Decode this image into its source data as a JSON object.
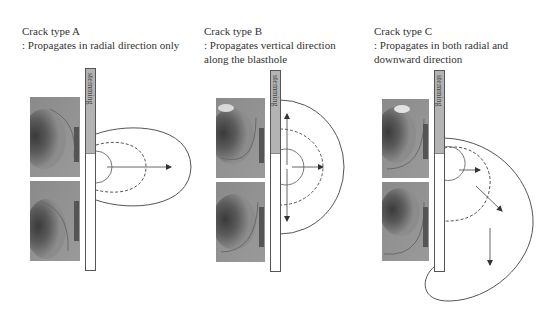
{
  "panels": [
    {
      "id": "A",
      "title": "Crack type A",
      "description_lines": [
        ": Propagates in radial direction only"
      ],
      "stemming_label": "stemming"
    },
    {
      "id": "B",
      "title": "Crack type B",
      "description_lines": [
        ": Propagates vertical direction",
        "along the blasthole"
      ],
      "stemming_label": "stemming"
    },
    {
      "id": "C",
      "title": "Crack type C",
      "description_lines": [
        ": Propagates in both radial and",
        "downward direction"
      ],
      "stemming_label": "stemming"
    }
  ],
  "colors": {
    "text": "#333333",
    "stemming": "#b3b3b3",
    "line": "#555555"
  }
}
